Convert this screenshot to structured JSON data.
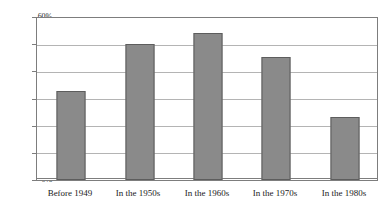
{
  "chart_data": {
    "type": "bar",
    "title": "",
    "subtitle": "",
    "xlabel": "",
    "ylabel": "",
    "categories": [
      "Before 1949",
      "In the 1950s",
      "In the 1960s",
      "In the 1970s",
      "In the 1980s"
    ],
    "values": [
      33,
      50.5,
      54.5,
      45.5,
      23.5
    ],
    "value_labels": [
      "33%",
      "50.5%",
      "54.5%",
      "45.5%",
      "23.5%"
    ],
    "ylim": [
      0,
      60
    ],
    "ytick_values": [
      0,
      10,
      20,
      30,
      40,
      50,
      60
    ],
    "ytick_labels": [
      "0%",
      "10%",
      "20%",
      "30%",
      "40%",
      "50%",
      "60%"
    ],
    "ytick_step": 10,
    "grid": true,
    "grid_axis": "y",
    "legend": false,
    "legend_position": "none",
    "series": [
      {
        "name": "",
        "values": [
          33,
          50.5,
          54.5,
          45.5,
          23.5
        ]
      }
    ]
  },
  "style": {
    "bar_fill": "#8a8a8a",
    "bar_border": "#5d5d5d",
    "gridline_color": "#b4b4b4",
    "frame_color": "#7d7d7d",
    "background": "#ffffff",
    "text_color": "#1a1a1a"
  }
}
